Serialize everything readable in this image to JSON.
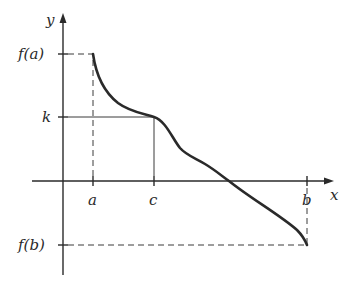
{
  "diagram": {
    "axes": {
      "x_label": "x",
      "y_label": "y"
    },
    "x_ticks": [
      {
        "label": "a"
      },
      {
        "label": "c"
      },
      {
        "label": "b"
      }
    ],
    "y_ticks": [
      {
        "label": "f(a)"
      },
      {
        "label": "k"
      },
      {
        "label": "f(b)"
      }
    ],
    "colors": {
      "ink": "#2a2a2a",
      "background": "#ffffff"
    }
  }
}
